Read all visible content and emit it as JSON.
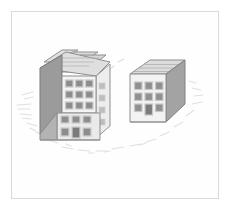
{
  "scene": {
    "title": "Isometric sketch of two apartment buildings",
    "medium": "pencil sketch",
    "page_background": "#ffffff",
    "frame_color": "#d9d9d9",
    "frame": {
      "x": 11,
      "y": 11,
      "width": 208,
      "height": 188
    }
  },
  "palette": {
    "outline": "#8a8a8a",
    "outline_dark": "#6f6f6f",
    "face_front": "#f2f2f2",
    "face_front_lower": "#e9e9e9",
    "face_side_dark": "#9a9a9a",
    "face_side_mid": "#b3b3b3",
    "roof_top": "#d8d8d8",
    "roof_top_light": "#e4e4e4",
    "window_fill": "#8f8f8f",
    "window_frame": "#cfcfcf",
    "door_fill": "#7d7d7d",
    "scribble": "#dddddd"
  },
  "objects": [
    {
      "id": "building-left",
      "name": "Tall apartment building (left, foreground)",
      "stories_upper": 3,
      "stories_lower": 2,
      "window_grid_upper": {
        "rows": 3,
        "cols": 3,
        "count": 9
      },
      "window_grid_lower": {
        "rows": 2,
        "cols": 3,
        "count": 6
      },
      "doors": 1,
      "roof_type": "stepped tiered slabs",
      "roof_slabs": 3,
      "side_face_windows": 4,
      "bounding_box": {
        "x": 36,
        "y": 48,
        "width": 80,
        "height": 92
      }
    },
    {
      "id": "building-right",
      "name": "Short apartment building (right, background)",
      "stories": 3,
      "window_grid": {
        "rows": 3,
        "cols": 3,
        "count": 9
      },
      "doors": 1,
      "roof_type": "flat slab with ridge lines",
      "roof_ridge_lines": 3,
      "bounding_box": {
        "x": 128,
        "y": 60,
        "width": 57,
        "height": 62
      }
    }
  ],
  "scribbles": {
    "description": "Faint pencil scribble marks arranged in an arc around and below the buildings",
    "color": "#dcdcdc",
    "marks": [
      {
        "x": 22,
        "y": 95,
        "w": 12,
        "h": 3,
        "r": -18
      },
      {
        "x": 18,
        "y": 104,
        "w": 14,
        "h": 3,
        "r": -8
      },
      {
        "x": 20,
        "y": 113,
        "w": 12,
        "h": 3,
        "r": 4
      },
      {
        "x": 26,
        "y": 122,
        "w": 10,
        "h": 3,
        "r": 14
      },
      {
        "x": 36,
        "y": 132,
        "w": 9,
        "h": 3,
        "r": 22
      },
      {
        "x": 48,
        "y": 140,
        "w": 10,
        "h": 3,
        "r": 14
      },
      {
        "x": 62,
        "y": 147,
        "w": 11,
        "h": 3,
        "r": 8
      },
      {
        "x": 78,
        "y": 150,
        "w": 12,
        "h": 3,
        "r": 2
      },
      {
        "x": 96,
        "y": 151,
        "w": 10,
        "h": 3,
        "r": -2
      },
      {
        "x": 112,
        "y": 149,
        "w": 12,
        "h": 3,
        "r": -5
      },
      {
        "x": 130,
        "y": 146,
        "w": 11,
        "h": 3,
        "r": -8
      },
      {
        "x": 146,
        "y": 142,
        "w": 10,
        "h": 3,
        "r": -12
      },
      {
        "x": 160,
        "y": 136,
        "w": 9,
        "h": 3,
        "r": -18
      },
      {
        "x": 174,
        "y": 127,
        "w": 9,
        "h": 3,
        "r": -26
      },
      {
        "x": 186,
        "y": 116,
        "w": 10,
        "h": 3,
        "r": -38
      },
      {
        "x": 192,
        "y": 104,
        "w": 11,
        "h": 3,
        "r": -10
      },
      {
        "x": 194,
        "y": 94,
        "w": 10,
        "h": 3,
        "r": -4
      },
      {
        "x": 190,
        "y": 84,
        "w": 10,
        "h": 3,
        "r": 12
      },
      {
        "x": 118,
        "y": 62,
        "w": 7,
        "h": 3,
        "r": 30
      },
      {
        "x": 108,
        "y": 70,
        "w": 6,
        "h": 3,
        "r": 40
      }
    ]
  }
}
